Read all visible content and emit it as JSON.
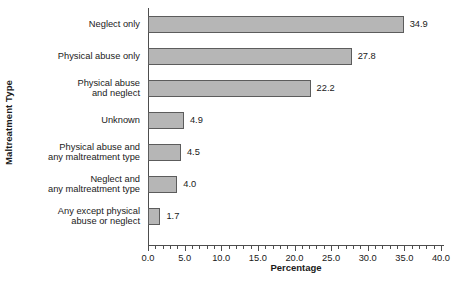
{
  "chart_data": {
    "type": "bar",
    "orientation": "horizontal",
    "title": "",
    "xlabel": "Percentage",
    "ylabel": "Maltreatment Type",
    "xlim": [
      0.0,
      40.0
    ],
    "xticks": [
      "0.0",
      "5.0",
      "10.0",
      "15.0",
      "20.0",
      "25.0",
      "30.0",
      "35.0",
      "40.0"
    ],
    "xtick_values": [
      0,
      5,
      10,
      15,
      20,
      25,
      30,
      35,
      40
    ],
    "minor_tick_step": 1.0,
    "grid": false,
    "legend": null,
    "bar_color": "#b6b6b6",
    "bar_border_color": "#5c5c5c",
    "categories": [
      "Neglect only",
      "Physical abuse only",
      "Physical abuse\nand neglect",
      "Unknown",
      "Physical abuse and\nany maltreatment type",
      "Neglect and\nany maltreatment type",
      "Any except physical\nabuse or neglect"
    ],
    "values": [
      34.9,
      27.8,
      22.2,
      4.9,
      4.5,
      4.0,
      1.7
    ],
    "value_labels": [
      "34.9",
      "27.8",
      "22.2",
      "4.9",
      "4.5",
      "4.0",
      "1.7"
    ]
  },
  "caption": {
    "text": ""
  }
}
